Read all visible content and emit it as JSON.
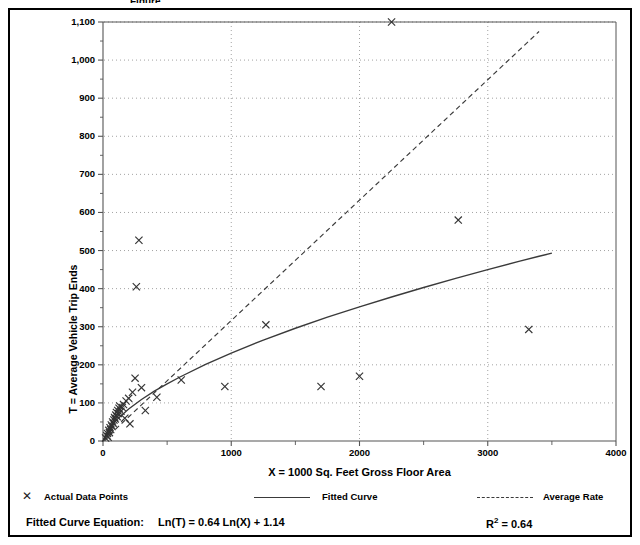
{
  "chart_data": {
    "type": "scatter",
    "title": "",
    "xlabel": "X = 1000 Sq. Feet Gross Floor Area",
    "ylabel": "T = Average Vehicle Trip Ends",
    "xlim": [
      0,
      4000
    ],
    "ylim": [
      0,
      1100
    ],
    "xticks": [
      0,
      1000,
      2000,
      3000,
      4000
    ],
    "xtick_labels": [
      "0",
      "1000",
      "2000",
      "3000",
      "4000"
    ],
    "xminor_step": 500,
    "yticks": [
      0,
      100,
      200,
      300,
      400,
      500,
      600,
      700,
      800,
      900,
      1000,
      1100
    ],
    "ytick_labels": [
      "0",
      "100",
      "200",
      "300",
      "400",
      "500",
      "600",
      "700",
      "800",
      "900",
      "1,000",
      "1,100"
    ],
    "yminor_step": 50,
    "grid": "dotted gridlines at major x and y ticks",
    "legend_position": "below-axis",
    "series": [
      {
        "name": "Actual Data Points",
        "type": "scatter",
        "marker": "x",
        "color": "#333333",
        "points": [
          [
            20,
            8
          ],
          [
            30,
            14
          ],
          [
            35,
            20
          ],
          [
            40,
            10
          ],
          [
            45,
            28
          ],
          [
            50,
            22
          ],
          [
            55,
            35
          ],
          [
            60,
            30
          ],
          [
            65,
            42
          ],
          [
            70,
            38
          ],
          [
            75,
            50
          ],
          [
            80,
            46
          ],
          [
            85,
            55
          ],
          [
            90,
            62
          ],
          [
            95,
            58
          ],
          [
            100,
            68
          ],
          [
            105,
            75
          ],
          [
            110,
            64
          ],
          [
            115,
            80
          ],
          [
            120,
            72
          ],
          [
            125,
            86
          ],
          [
            130,
            92
          ],
          [
            140,
            78
          ],
          [
            150,
            88
          ],
          [
            160,
            96
          ],
          [
            170,
            60
          ],
          [
            180,
            105
          ],
          [
            200,
            112
          ],
          [
            210,
            45
          ],
          [
            230,
            128
          ],
          [
            250,
            165
          ],
          [
            260,
            405
          ],
          [
            280,
            527
          ],
          [
            300,
            140
          ],
          [
            330,
            80
          ],
          [
            420,
            115
          ],
          [
            610,
            160
          ],
          [
            950,
            143
          ],
          [
            1270,
            305
          ],
          [
            1700,
            143
          ],
          [
            2000,
            170
          ],
          [
            2250,
            1100
          ],
          [
            2770,
            580
          ],
          [
            3320,
            293
          ]
        ]
      },
      {
        "name": "Fitted Curve",
        "type": "line",
        "style": "solid",
        "color": "#3a3a3a",
        "equation": "Ln(T) = 0.64 Ln(X) + 1.14",
        "points": [
          [
            0,
            0
          ],
          [
            50,
            35
          ],
          [
            100,
            54
          ],
          [
            200,
            84
          ],
          [
            300,
            109
          ],
          [
            400,
            131
          ],
          [
            500,
            150
          ],
          [
            600,
            168
          ],
          [
            800,
            201
          ],
          [
            1000,
            231
          ],
          [
            1250,
            265
          ],
          [
            1500,
            296
          ],
          [
            1750,
            325
          ],
          [
            2000,
            352
          ],
          [
            2250,
            378
          ],
          [
            2500,
            403
          ],
          [
            2750,
            427
          ],
          [
            3000,
            450
          ],
          [
            3250,
            472
          ],
          [
            3400,
            485
          ],
          [
            3500,
            493
          ]
        ]
      },
      {
        "name": "Average Rate",
        "type": "line",
        "style": "dashed",
        "color": "#3a3a3a",
        "points": [
          [
            0,
            0
          ],
          [
            3400,
            1075
          ]
        ]
      }
    ],
    "annotations": {
      "equation_label": "Fitted Curve Equation:",
      "equation": "Ln(T) = 0.64 Ln(X) + 1.14",
      "r_squared_label": "R",
      "r_squared_exponent": "2",
      "r_squared_value": "= 0.64",
      "r_squared_full": "R2 = 0.64"
    }
  },
  "legend": {
    "items": [
      {
        "label": "Actual Data Points",
        "marker": "x-marker-icon"
      },
      {
        "label": "Fitted Curve",
        "marker": "solid-line-icon"
      },
      {
        "label": "Average Rate",
        "marker": "dashed-line-icon"
      }
    ]
  },
  "equation_row": {
    "prefix": "Fitted Curve Equation:",
    "formula": "Ln(T) = 0.64 Ln(X) + 1.14",
    "r2_base": "R",
    "r2_sup": "2",
    "r2_rest": " = 0.64"
  },
  "top_clipped_text": "Figure",
  "colors": {
    "line": "#3a3a3a",
    "marker": "#333333",
    "grid": "#999999",
    "axis": "#555555",
    "frame": "#000000"
  }
}
